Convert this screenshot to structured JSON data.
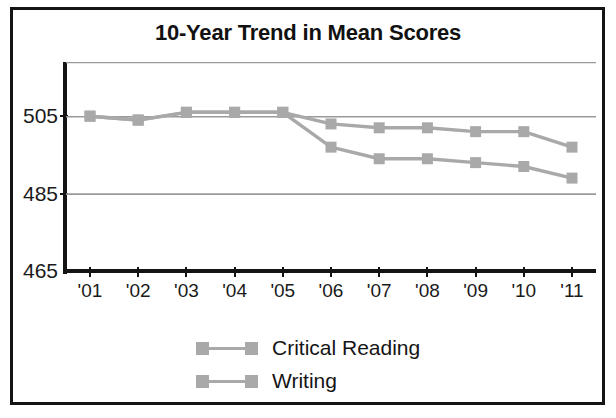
{
  "chart_data": {
    "type": "line",
    "title": "10-Year Trend in Mean Scores",
    "xlabel": "",
    "ylabel": "",
    "x": [
      "'01",
      "'02",
      "'03",
      "'04",
      "'05",
      "'06",
      "'07",
      "'08",
      "'09",
      "'10",
      "'11"
    ],
    "categories": [
      "'01",
      "'02",
      "'03",
      "'04",
      "'05",
      "'06",
      "'07",
      "'08",
      "'09",
      "'10",
      "'11"
    ],
    "series": [
      {
        "name": "Critical Reading",
        "color": "#a9a9a9",
        "values": [
          505,
          504,
          506,
          506,
          506,
          503,
          502,
          502,
          501,
          501,
          497
        ]
      },
      {
        "name": "Writing",
        "color": "#a9a9a9",
        "values": [
          505,
          504,
          506,
          506,
          506,
          497,
          494,
          494,
          493,
          492,
          489
        ]
      }
    ],
    "ylim": [
      465,
      519
    ],
    "yticks": [
      465,
      485,
      505
    ],
    "ytick_labels": [
      "465",
      "485",
      "505"
    ],
    "gridlines": [
      485,
      505,
      519
    ],
    "grid": true,
    "legend_position": "bottom-center",
    "marker": "square"
  },
  "legend": {
    "entries": [
      {
        "label": "Critical Reading"
      },
      {
        "label": "Writing"
      }
    ]
  },
  "colors": {
    "series_gray": "#a9a9a9",
    "grid_gray": "#9a9a9a",
    "axis_black": "#141414",
    "text_black": "#1a1a1a",
    "border_black": "#141414",
    "background": "#ffffff"
  }
}
